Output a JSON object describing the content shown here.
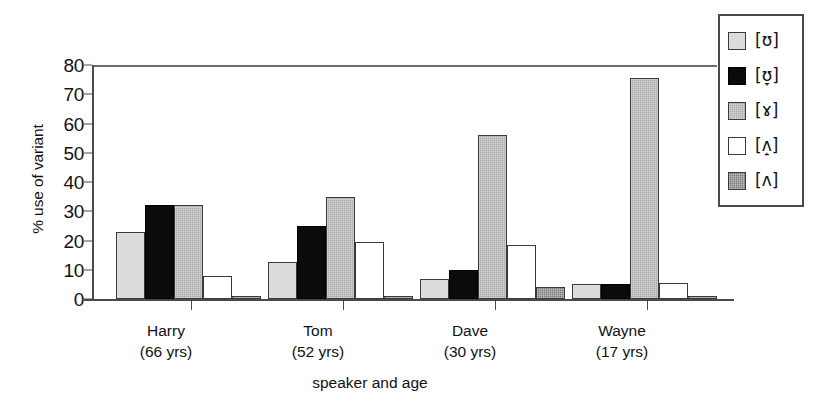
{
  "chart_data": {
    "type": "bar",
    "title": "",
    "xlabel": "speaker and age",
    "ylabel": "% use of variant",
    "ylim": [
      0,
      80
    ],
    "yticks": [
      0,
      10,
      20,
      30,
      40,
      50,
      60,
      70,
      80
    ],
    "grid": false,
    "legend_position": "right",
    "categories": [
      "Harry\n(66 yrs)",
      "Tom\n(52 yrs)",
      "Dave\n(30 yrs)",
      "Wayne\n(17 yrs)"
    ],
    "category_lines": [
      [
        "Harry",
        "(66 yrs)"
      ],
      [
        "Tom",
        "(52 yrs)"
      ],
      [
        "Dave",
        "(30 yrs)"
      ],
      [
        "Wayne",
        "(17 yrs)"
      ]
    ],
    "series": [
      {
        "name": "[ʊ]",
        "fill": "light-gray",
        "color": "#dcdcdc",
        "values": [
          23,
          12.5,
          7,
          5
        ]
      },
      {
        "name": "[ʊ̞]",
        "fill": "black",
        "color": "#0b0b0b",
        "values": [
          32,
          25,
          10,
          5
        ]
      },
      {
        "name": "[ɤ]",
        "fill": "medium-gray",
        "color": "#a8a8a8",
        "values": [
          32,
          35,
          56,
          75.5
        ]
      },
      {
        "name": "[ʌ̝]",
        "fill": "white",
        "color": "#ffffff",
        "values": [
          8,
          19.5,
          18.5,
          5.5
        ]
      },
      {
        "name": "[ʌ]",
        "fill": "dark-gray",
        "color": "#7b7b7b",
        "values": [
          1,
          0.7,
          4,
          1
        ]
      }
    ]
  },
  "axis": {
    "y_title": "% use of variant",
    "x_title": "speaker and age",
    "y_tick_labels": [
      "80",
      "70",
      "60",
      "50",
      "40",
      "30",
      "20",
      "10",
      "0"
    ]
  },
  "legend": {
    "entries": [
      {
        "label": "[ʊ]"
      },
      {
        "label": "[ʊ̞]"
      },
      {
        "label": "[ɤ]"
      },
      {
        "label": "[ʌ̝]"
      },
      {
        "label": "[ʌ]"
      }
    ]
  }
}
